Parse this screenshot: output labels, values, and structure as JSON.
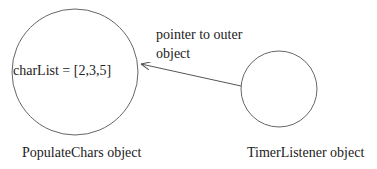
{
  "diagram": {
    "nodes": [
      {
        "id": "populate-chars",
        "label": "PopulateChars object",
        "content": "charList = [2,3,5]"
      },
      {
        "id": "timer-listener",
        "label": "TimerListener object",
        "content": ""
      }
    ],
    "edges": [
      {
        "from": "timer-listener",
        "to": "populate-chars",
        "label_line1": "pointer to outer",
        "label_line2": "object"
      }
    ],
    "colors": {
      "stroke": "#555555",
      "text": "#222222",
      "background": "#ffffff"
    }
  }
}
